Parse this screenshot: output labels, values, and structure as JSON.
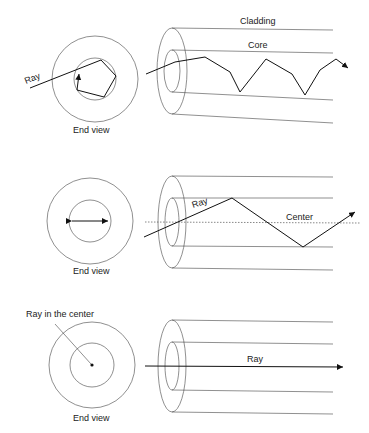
{
  "panels": [
    {
      "id": "skew",
      "end_view_label": "End view",
      "ray_label": "Ray",
      "core_label": "Core",
      "cladding_label": "Cladding"
    },
    {
      "id": "meridional",
      "end_view_label": "End view",
      "ray_label": "Ray",
      "center_label": "Center"
    },
    {
      "id": "axial",
      "end_view_label": "End view",
      "ray_label": "Ray",
      "ray_center_label": "Ray in the center"
    }
  ],
  "colors": {
    "line": "#444444",
    "ray": "#111111",
    "background": "#ffffff"
  }
}
